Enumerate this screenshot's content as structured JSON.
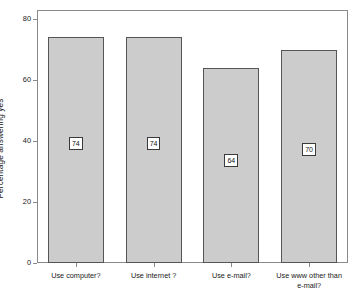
{
  "chart_data": {
    "type": "bar",
    "title": "",
    "xlabel": "",
    "ylabel": "Percentage answering yes",
    "categories": [
      "Use computer?",
      "Use internet ?",
      "Use e-mail?",
      "Use www other than\ne-mail?"
    ],
    "values": [
      74,
      74,
      64,
      70
    ],
    "data_labels": [
      "74",
      "74",
      "64",
      "70"
    ],
    "ylim": [
      0,
      80
    ],
    "yticks": [
      0,
      20,
      40,
      60,
      80
    ],
    "ytick_labels": [
      "0",
      "20",
      "40",
      "60",
      "80"
    ],
    "grid": false,
    "legend": null,
    "bar_fill_color": "#cccccc",
    "bar_border_color": "#555555",
    "frame_color": "#8a8a8a",
    "background_color": "#ffffff"
  }
}
